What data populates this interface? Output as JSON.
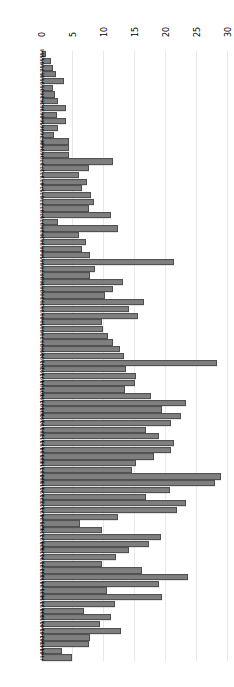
{
  "chart_data": {
    "type": "bar",
    "orientation": "horizontal",
    "title": "",
    "xlabel": "",
    "ylabel": "",
    "xlim": [
      0,
      31
    ],
    "xticks": [
      0,
      5,
      10,
      15,
      20,
      25,
      30
    ],
    "grid": true,
    "legend": null,
    "rotation_deg": 180,
    "bar_color": "#7f7f7f",
    "bar_edge_color": "#4d4d4d",
    "grid_color": "#e9e9e9",
    "categories": [
      "I144",
      "I143",
      "I142",
      "I141",
      "I140",
      "I139",
      "I138",
      "I137",
      "I136",
      "I135",
      "I134",
      "I133",
      "I132",
      "I131",
      "I130",
      "I129",
      "I128",
      "I127",
      "I126",
      "I125",
      "I124",
      "I123",
      "I122",
      "I121",
      "I120",
      "I119",
      "I118",
      "I117",
      "I116",
      "I115",
      "I114",
      "I113",
      "I112",
      "I111",
      "I110",
      "I109",
      "I108",
      "I107",
      "I106",
      "I105",
      "I104",
      "I103",
      "I102",
      "I101",
      "I100",
      "I99",
      "I98",
      "I97",
      "I96",
      "I95",
      "I94",
      "I93",
      "I92",
      "I91",
      "I90",
      "I89",
      "I88",
      "I87",
      "I86",
      "I85",
      "I84",
      "I83",
      "I82",
      "I81",
      "I80",
      "I79",
      "I78",
      "I77",
      "I76",
      "I75",
      "I74",
      "I73",
      "I72",
      "I71",
      "I70",
      "I69",
      "I68",
      "I67",
      "I66",
      "I65",
      "I64",
      "I63",
      "I62",
      "I61",
      "I60",
      "I59",
      "I58",
      "I57",
      "I56",
      "I55",
      "I54"
    ],
    "values": [
      4.6,
      2.9,
      7.2,
      7.4,
      12.4,
      9.1,
      10.8,
      6.4,
      11.4,
      19.0,
      10.1,
      18.5,
      23.3,
      15.9,
      9.4,
      11.7,
      13.8,
      17.0,
      18.9,
      9.3,
      5.8,
      12.0,
      21.5,
      23.0,
      16.5,
      20.4,
      27.6,
      28.6,
      14.2,
      14.9,
      17.8,
      20.5,
      21.0,
      18.6,
      16.5,
      20.5,
      22.2,
      19.0,
      22.9,
      17.2,
      13.0,
      14.7,
      14.8,
      13.2,
      27.9,
      12.9,
      12.3,
      11.2,
      10.4,
      9.5,
      9.3,
      15.2,
      13.7,
      16.2,
      9.9,
      11.1,
      12.8,
      7.4,
      8.3,
      21.0,
      7.5,
      6.2,
      6.8,
      5.6,
      12.0,
      2.2,
      10.8,
      7.2,
      8.0,
      7.6,
      6.1,
      6.9,
      5.6,
      7.3,
      11.2,
      4.0,
      4.0,
      4.1,
      1.6,
      2.3,
      3.5,
      2.1,
      3.5,
      2.2,
      1.8,
      1.5,
      3.2,
      1.9,
      1.4,
      1.2,
      0.4
    ]
  }
}
